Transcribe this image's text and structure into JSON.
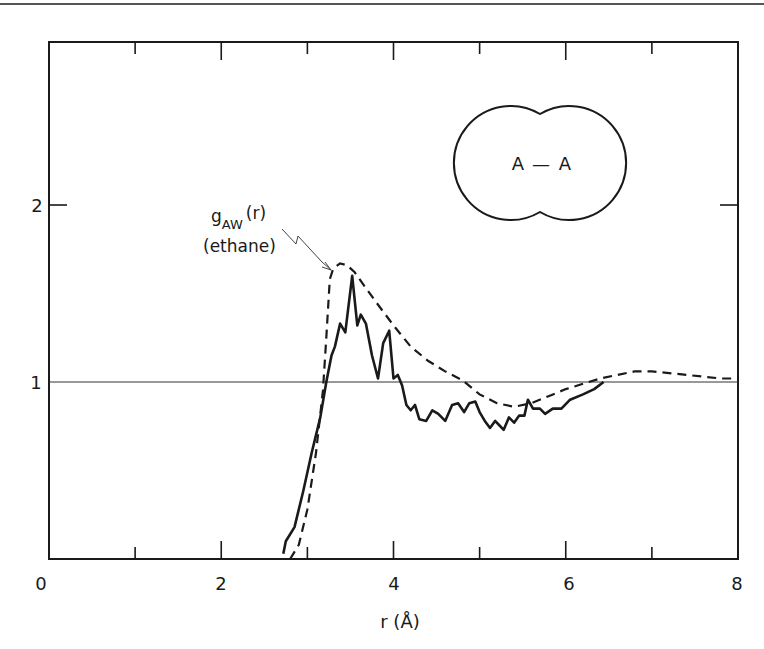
{
  "chart_data": {
    "type": "line",
    "title": "",
    "xlabel": "r (Å)",
    "ylabel": "",
    "xlim": [
      0,
      8
    ],
    "ylim": [
      0,
      2.93
    ],
    "grid": false,
    "x_ticks": [
      0,
      1,
      2,
      3,
      4,
      5,
      6,
      7,
      8
    ],
    "x_tick_labels": [
      "0",
      "",
      "2",
      "",
      "4",
      "",
      "6",
      "",
      "8"
    ],
    "y_ticks": [
      1,
      2
    ],
    "y_tick_labels": [
      "1",
      "2"
    ],
    "reference_line": {
      "y": 1,
      "style": "thin solid"
    },
    "inset": {
      "shape": "two overlapping circles (dumbbell)",
      "label": "A — A"
    },
    "annotation": {
      "text_main": "g",
      "text_sub": "AW",
      "text_arg": "(r)",
      "text_line2": "(ethane)",
      "points_to_series": "g_AW(r) (ethane)"
    },
    "series": [
      {
        "name": "A–A (solid)",
        "style": "solid",
        "x": [
          2.72,
          2.75,
          2.85,
          2.95,
          3.05,
          3.15,
          3.22,
          3.28,
          3.32,
          3.38,
          3.44,
          3.52,
          3.58,
          3.62,
          3.68,
          3.75,
          3.82,
          3.88,
          3.95,
          4.0,
          4.05,
          4.1,
          4.15,
          4.2,
          4.25,
          4.3,
          4.38,
          4.45,
          4.52,
          4.6,
          4.68,
          4.75,
          4.82,
          4.88,
          4.95,
          5.0,
          5.06,
          5.12,
          5.18,
          5.22,
          5.28,
          5.34,
          5.4,
          5.46,
          5.52,
          5.56,
          5.62,
          5.7,
          5.76,
          5.85,
          5.95,
          6.05,
          6.2,
          6.33,
          6.44
        ],
        "values": [
          0.03,
          0.1,
          0.18,
          0.38,
          0.6,
          0.8,
          1.0,
          1.15,
          1.2,
          1.33,
          1.28,
          1.6,
          1.32,
          1.38,
          1.33,
          1.15,
          1.02,
          1.22,
          1.29,
          1.02,
          1.04,
          0.98,
          0.87,
          0.84,
          0.87,
          0.79,
          0.78,
          0.84,
          0.82,
          0.78,
          0.87,
          0.88,
          0.83,
          0.88,
          0.89,
          0.83,
          0.78,
          0.74,
          0.78,
          0.76,
          0.73,
          0.8,
          0.77,
          0.81,
          0.81,
          0.9,
          0.85,
          0.85,
          0.82,
          0.85,
          0.85,
          0.9,
          0.93,
          0.96,
          1.0
        ]
      },
      {
        "name": "g_AW(r) (ethane) (dashed)",
        "style": "dashed",
        "x": [
          2.8,
          2.9,
          3.0,
          3.1,
          3.18,
          3.22,
          3.26,
          3.3,
          3.38,
          3.46,
          3.55,
          3.65,
          3.8,
          4.0,
          4.2,
          4.4,
          4.6,
          4.8,
          5.0,
          5.2,
          5.4,
          5.6,
          5.8,
          6.0,
          6.2,
          6.4,
          6.6,
          6.8,
          7.0,
          7.2,
          7.4,
          7.6,
          7.8,
          8.0
        ],
        "values": [
          0.0,
          0.08,
          0.28,
          0.6,
          0.95,
          1.25,
          1.58,
          1.64,
          1.67,
          1.66,
          1.62,
          1.55,
          1.45,
          1.32,
          1.2,
          1.12,
          1.06,
          1.01,
          0.93,
          0.88,
          0.86,
          0.88,
          0.92,
          0.96,
          0.99,
          1.02,
          1.04,
          1.06,
          1.06,
          1.05,
          1.04,
          1.03,
          1.02,
          1.02
        ]
      }
    ]
  },
  "labels": {
    "x_axis": "r (Å)",
    "tick_0": "0",
    "tick_2": "2",
    "tick_4": "4",
    "tick_6": "6",
    "tick_8": "8",
    "ytick_1": "1",
    "ytick_2": "2",
    "inset_left": "A",
    "inset_dash": "—",
    "inset_right": "A",
    "annot_g": "g",
    "annot_sub": "AW",
    "annot_arg": "(r)",
    "annot_line2": "(ethane)"
  },
  "colors": {
    "ink": "#1a1a1a",
    "background": "#ffffff"
  }
}
